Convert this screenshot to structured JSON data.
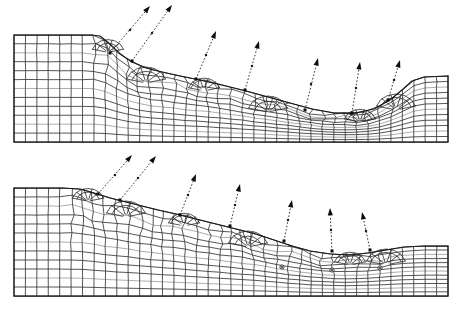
{
  "figure": {
    "background_color": "#ffffff",
    "line_color": "#2b2b2b",
    "outline_color": "#1b1b1b",
    "vector_color": "#0d0d0d",
    "width_px": 460,
    "height_px": 311
  },
  "chart_data": {
    "type": "mesh-diagram",
    "xlabel": "",
    "ylabel": "",
    "xlim": [
      0,
      460
    ],
    "ylim": [
      0,
      311
    ],
    "grid": false,
    "legend": "none",
    "panels": [
      {
        "name": "upper-panel",
        "label": "Upper deformed mesh (larger slope displacement)",
        "domain": {
          "x0": 14,
          "x1": 448,
          "y_top_left": 35,
          "y_bottom": 142
        },
        "surface_profile": [
          [
            14,
            35
          ],
          [
            40,
            35
          ],
          [
            66,
            35
          ],
          [
            92,
            35
          ],
          [
            100,
            36
          ],
          [
            110,
            44
          ],
          [
            120,
            54
          ],
          [
            132,
            62
          ],
          [
            146,
            68
          ],
          [
            162,
            72
          ],
          [
            180,
            76
          ],
          [
            200,
            80
          ],
          [
            222,
            85
          ],
          [
            246,
            91
          ],
          [
            268,
            97
          ],
          [
            290,
            103
          ],
          [
            312,
            109
          ],
          [
            334,
            113
          ],
          [
            356,
            113
          ],
          [
            374,
            109
          ],
          [
            390,
            100
          ],
          [
            402,
            90
          ],
          [
            412,
            81
          ],
          [
            424,
            77
          ],
          [
            448,
            76
          ]
        ],
        "crest_x": 100,
        "toe_x": 366,
        "vectors": [
          {
            "id": "u1",
            "origin": [
              110,
              53
            ],
            "tip": [
              150,
              6
            ],
            "mid": [
              130,
              30
            ]
          },
          {
            "id": "u2",
            "origin": [
              132,
              61
            ],
            "tip": [
              172,
              5
            ],
            "mid": [
              152,
              33
            ]
          },
          {
            "id": "u3",
            "origin": [
              196,
              79
            ],
            "tip": [
              216,
              31
            ],
            "mid": [
              206,
              55
            ]
          },
          {
            "id": "u4",
            "origin": [
              245,
              90
            ],
            "tip": [
              259,
              41
            ],
            "mid": [
              252,
              66
            ]
          },
          {
            "id": "u5",
            "origin": [
              305,
              110
            ],
            "tip": [
              318,
              58
            ],
            "mid": [
              311,
              84
            ]
          },
          {
            "id": "u6",
            "origin": [
              352,
              113
            ],
            "tip": [
              360,
              62
            ],
            "mid": [
              356,
              88
            ]
          },
          {
            "id": "u7",
            "origin": [
              388,
              100
            ],
            "tip": [
              400,
              60
            ],
            "mid": [
              394,
              80
            ]
          }
        ]
      },
      {
        "name": "lower-panel",
        "label": "Lower deformed mesh (earlier / smaller slope displacement)",
        "domain": {
          "x0": 14,
          "x1": 448,
          "y_top_left": 188,
          "y_bottom": 296
        },
        "surface_profile": [
          [
            14,
            188
          ],
          [
            40,
            188
          ],
          [
            62,
            188
          ],
          [
            80,
            189
          ],
          [
            94,
            193
          ],
          [
            110,
            198
          ],
          [
            126,
            202
          ],
          [
            142,
            206
          ],
          [
            158,
            210
          ],
          [
            176,
            214
          ],
          [
            196,
            219
          ],
          [
            216,
            224
          ],
          [
            236,
            229
          ],
          [
            256,
            234
          ],
          [
            274,
            240
          ],
          [
            292,
            246
          ],
          [
            310,
            251
          ],
          [
            330,
            254
          ],
          [
            350,
            255
          ],
          [
            368,
            253
          ],
          [
            386,
            250
          ],
          [
            404,
            247
          ],
          [
            424,
            246
          ],
          [
            448,
            246
          ]
        ],
        "crest_x": 80,
        "toe_x": 356,
        "vectors": [
          {
            "id": "l1",
            "origin": [
              98,
              194
            ],
            "tip": [
              132,
              155
            ],
            "mid": [
              115,
              175
            ]
          },
          {
            "id": "l2",
            "origin": [
              120,
              200
            ],
            "tip": [
              156,
              156
            ],
            "mid": [
              138,
              178
            ]
          },
          {
            "id": "l3",
            "origin": [
              180,
              215
            ],
            "tip": [
              196,
              174
            ],
            "mid": [
              188,
              195
            ]
          },
          {
            "id": "l4",
            "origin": [
              230,
              226
            ],
            "tip": [
              240,
              184
            ],
            "mid": [
              235,
              205
            ]
          },
          {
            "id": "l5",
            "origin": [
              284,
              241
            ],
            "tip": [
              292,
              200
            ],
            "mid": [
              288,
              220
            ]
          },
          {
            "id": "l6",
            "origin": [
              332,
              251
            ],
            "tip": [
              330,
              208
            ],
            "mid": [
              331,
              230
            ]
          },
          {
            "id": "l7",
            "origin": [
              370,
              250
            ],
            "tip": [
              362,
              212
            ],
            "mid": [
              366,
              231
            ]
          }
        ],
        "ring_nodes": [
          [
            282,
            267
          ],
          [
            332,
            270
          ],
          [
            380,
            268
          ]
        ]
      }
    ],
    "notes": [
      "Mesh is a structured quadrilateral grid distorted near the slope face.",
      "Fan-shaped element clusters mark localized shear-band distortion.",
      "Dashed vectors with solid triangular arrowheads show nodal displacement direction (up-slope and outward)."
    ]
  }
}
